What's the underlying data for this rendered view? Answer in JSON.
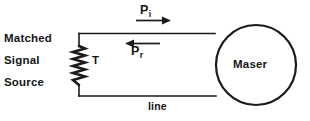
{
  "diagram": {
    "source_label": {
      "line1": "Matched",
      "line2": "Signal",
      "line3": "Source"
    },
    "components": {
      "coil_label": "T",
      "maser_label": "Maser",
      "line_label": "line"
    },
    "power_flows": [
      {
        "symbol": "P",
        "subscript": "i",
        "name": "incident-power",
        "direction": "right"
      },
      {
        "symbol": "P",
        "subscript": "r",
        "name": "reflected-power",
        "direction": "left"
      }
    ],
    "colors": {
      "ink": "#151515",
      "wire": "#1a1a1a",
      "background": "#ffffff"
    }
  }
}
